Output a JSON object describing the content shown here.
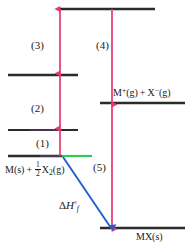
{
  "diagram": {
    "colors": {
      "level_line": "#2b2b2b",
      "arrow_red": "#e8386d",
      "arrow_blue": "#1f5fd0",
      "level_green": "#35c85a",
      "level_purple": "#7a4f9e",
      "background": "#ffffff"
    },
    "steps": [
      {
        "id": "step-1",
        "label": "(1)"
      },
      {
        "id": "step-2",
        "label": "(2)"
      },
      {
        "id": "step-3",
        "label": "(3)"
      },
      {
        "id": "step-4",
        "label": "(4)"
      },
      {
        "id": "step-5",
        "label": "(5)"
      }
    ],
    "species": {
      "reactants": {
        "name": "elements-standard-state",
        "M": "M(s)",
        "plus": "+",
        "fraction_numerator": "1",
        "fraction_denominator": "2",
        "X2": "X",
        "X2_sub": "2",
        "X2_state": "(g)"
      },
      "ions": {
        "name": "gaseous-ions",
        "M_symbol": "M",
        "M_charge": "+",
        "M_state": "(g)",
        "plus": "+",
        "X_symbol": "X",
        "X_charge": "−",
        "X_state": "(g)"
      },
      "product": {
        "name": "ionic-solid",
        "formula": "MX(s)"
      }
    },
    "enthalpy": {
      "name": "enthalpy-of-formation",
      "delta": "Δ",
      "H": "H",
      "superscript": "°",
      "subscript": "f"
    },
    "levels": [
      {
        "id": "level-top",
        "y": 9,
        "x1": 57,
        "x2": 155
      },
      {
        "id": "level-second",
        "y": 75,
        "x1": 8,
        "x2": 78
      },
      {
        "id": "level-third",
        "y": 130,
        "x1": 8,
        "x2": 78
      },
      {
        "id": "level-base",
        "y": 156,
        "x1": 8,
        "x2": 92
      },
      {
        "id": "level-ions",
        "y": 103,
        "x1": 100,
        "x2": 185
      },
      {
        "id": "level-product",
        "y": 228,
        "x1": 100,
        "x2": 185
      }
    ]
  }
}
